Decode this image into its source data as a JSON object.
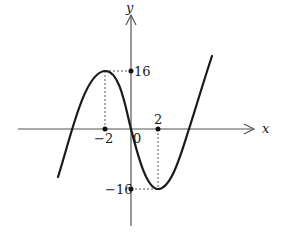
{
  "figure": {
    "type": "function-graph",
    "axes": {
      "x_label": "x",
      "y_label": "y",
      "origin_label": "0"
    },
    "ticks": {
      "x": [
        {
          "value": -2,
          "label": "−2"
        },
        {
          "value": 2,
          "label": "2"
        }
      ],
      "y": [
        {
          "value": 16,
          "label": "16"
        },
        {
          "value": -16,
          "label": "−16"
        }
      ]
    },
    "critical_points": [
      {
        "name": "local-maximum",
        "x": -2,
        "y": 16
      },
      {
        "name": "local-minimum",
        "x": 2,
        "y": -16
      }
    ],
    "curve": {
      "description": "cubic curve with local max at (-2,16) and local min at (2,-16)",
      "color": "#1a1a1a"
    },
    "guide_lines": "dashed",
    "colors": {
      "axis": "#555555",
      "curve": "#1a1a1a",
      "background": "#ffffff"
    }
  }
}
